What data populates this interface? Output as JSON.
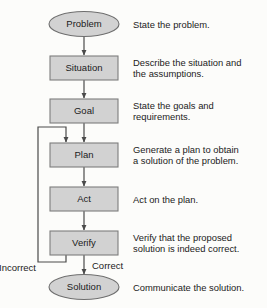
{
  "diagram": {
    "background_color": "#fcfcfa",
    "node_fill_color": "#d2d2d2",
    "node_border_color": "#7d7d7d",
    "line_color": "#4a4a4a",
    "nodes": [
      {
        "id": "problem",
        "label": "Problem",
        "shape": "ellipse",
        "description": "State the problem."
      },
      {
        "id": "situation",
        "label": "Situation",
        "shape": "rectangle",
        "description": "Describe the situation and\nthe assumptions."
      },
      {
        "id": "goal",
        "label": "Goal",
        "shape": "rectangle",
        "description": "State the goals and\nrequirements."
      },
      {
        "id": "plan",
        "label": "Plan",
        "shape": "rectangle",
        "description": "Generate a plan to obtain\na solution of the problem."
      },
      {
        "id": "act",
        "label": "Act",
        "shape": "rectangle",
        "description": "Act on the plan."
      },
      {
        "id": "verify",
        "label": "Verify",
        "shape": "rectangle",
        "description": "Verify that the proposed\nsolution is indeed correct."
      },
      {
        "id": "solution",
        "label": "Solution",
        "shape": "ellipse",
        "description": "Communicate the solution."
      }
    ],
    "branch_labels": {
      "incorrect": "Incorrect",
      "correct": "Correct"
    }
  }
}
